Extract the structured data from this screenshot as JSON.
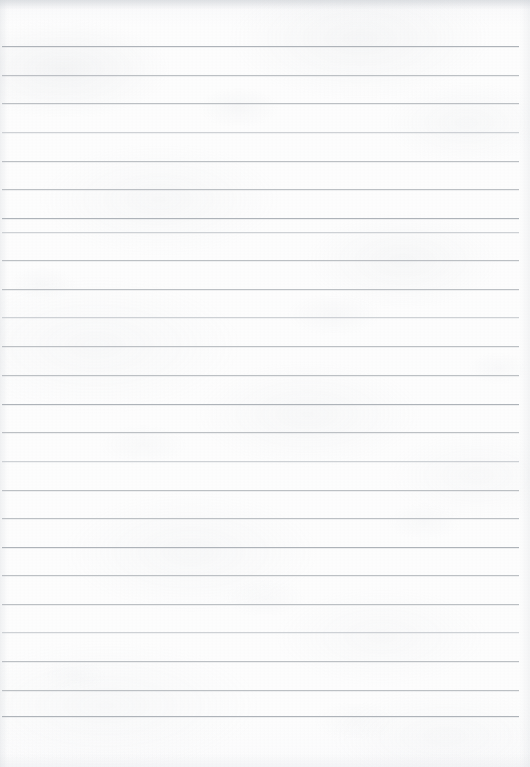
{
  "document": {
    "kind": "scanned-ruled-paper",
    "title": "Lined notebook page",
    "content_text": "",
    "is_blank": true,
    "page_width_px": 530,
    "page_height_px": 767
  },
  "paper": {
    "background_color": "#fdfdfd",
    "edge_tint_color": "#c4c8ce",
    "texture": "mottled scan grain"
  },
  "ruling": {
    "line_color": "#b9bdc2",
    "line_thickness_px": 1,
    "line_spacing_px": 28.7,
    "first_line_y_px": 46,
    "last_line_y_px": 716,
    "line_start_x_px": 2,
    "line_end_x_px": 519,
    "line_count": 24,
    "lines": [
      {
        "y": 46,
        "x1": 2,
        "x2": 519,
        "weight": "dark"
      },
      {
        "y": 75,
        "x1": 2,
        "x2": 519,
        "weight": "normal"
      },
      {
        "y": 103,
        "x1": 2,
        "x2": 519,
        "weight": "normal"
      },
      {
        "y": 132,
        "x1": 2,
        "x2": 519,
        "weight": "faint"
      },
      {
        "y": 161,
        "x1": 2,
        "x2": 519,
        "weight": "normal"
      },
      {
        "y": 189,
        "x1": 2,
        "x2": 519,
        "weight": "normal"
      },
      {
        "y": 218,
        "x1": 2,
        "x2": 519,
        "weight": "dark"
      },
      {
        "y": 232,
        "x1": 2,
        "x2": 519,
        "weight": "faint"
      },
      {
        "y": 260,
        "x1": 2,
        "x2": 519,
        "weight": "normal"
      },
      {
        "y": 289,
        "x1": 2,
        "x2": 519,
        "weight": "normal"
      },
      {
        "y": 317,
        "x1": 2,
        "x2": 519,
        "weight": "faint"
      },
      {
        "y": 346,
        "x1": 2,
        "x2": 519,
        "weight": "normal"
      },
      {
        "y": 375,
        "x1": 2,
        "x2": 519,
        "weight": "normal"
      },
      {
        "y": 404,
        "x1": 2,
        "x2": 519,
        "weight": "dark"
      },
      {
        "y": 432,
        "x1": 2,
        "x2": 519,
        "weight": "normal"
      },
      {
        "y": 461,
        "x1": 2,
        "x2": 519,
        "weight": "faint"
      },
      {
        "y": 490,
        "x1": 2,
        "x2": 519,
        "weight": "normal"
      },
      {
        "y": 518,
        "x1": 2,
        "x2": 519,
        "weight": "normal"
      },
      {
        "y": 547,
        "x1": 2,
        "x2": 519,
        "weight": "dark"
      },
      {
        "y": 575,
        "x1": 2,
        "x2": 519,
        "weight": "normal"
      },
      {
        "y": 604,
        "x1": 2,
        "x2": 519,
        "weight": "normal"
      },
      {
        "y": 632,
        "x1": 2,
        "x2": 519,
        "weight": "faint"
      },
      {
        "y": 661,
        "x1": 2,
        "x2": 519,
        "weight": "normal"
      },
      {
        "y": 690,
        "x1": 2,
        "x2": 519,
        "weight": "normal"
      },
      {
        "y": 716,
        "x1": 2,
        "x2": 519,
        "weight": "dark"
      }
    ]
  }
}
